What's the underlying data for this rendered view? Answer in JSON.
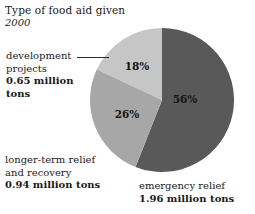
{
  "title": {
    "main": "Type of food aid given",
    "year": "2000"
  },
  "chart_data": {
    "type": "pie",
    "title": "Type of food aid given",
    "subtitle": "2000",
    "unit": "million tons",
    "grid": false,
    "legend_position": "callout-labels",
    "start_angle_deg": 0,
    "direction": "clockwise",
    "categories": [
      "emergency relief",
      "longer-term relief and recovery",
      "development projects"
    ],
    "values": [
      1.96,
      0.94,
      0.65
    ],
    "percentages": [
      56,
      26,
      18
    ],
    "percent_labels": [
      "56%",
      "26%",
      "18%"
    ],
    "colors": [
      "#595959",
      "#a7a7a7",
      "#c6c6c6"
    ],
    "slices": [
      {
        "name": "emergency relief",
        "percent": 56,
        "percent_label": "56%",
        "value": 1.96,
        "value_label": "1.96 million tons",
        "color": "#595959"
      },
      {
        "name": "longer-term relief and recovery",
        "percent": 26,
        "percent_label": "26%",
        "value": 0.94,
        "value_label": "0.94 million tons",
        "color": "#a7a7a7"
      },
      {
        "name": "development projects",
        "percent": 18,
        "percent_label": "18%",
        "value": 0.65,
        "value_label": "0.65 million tons",
        "color": "#c6c6c6"
      }
    ]
  },
  "callouts": {
    "development": {
      "line1": "development",
      "line2": "projects",
      "value_line1": "0.65 million",
      "value_line2": "tons"
    },
    "longer_term": {
      "line1": "longer-term relief",
      "line2": "and recovery",
      "value": "0.94 million tons"
    },
    "emergency": {
      "line1": "emergency relief",
      "value": "1.96 million tons"
    }
  }
}
